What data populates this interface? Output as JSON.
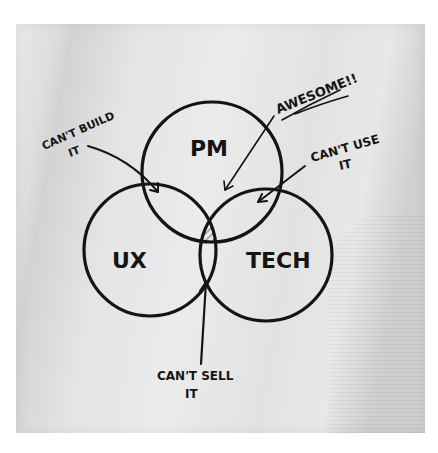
{
  "diagram": {
    "type": "venn",
    "medium": "hand-drawn on napkin",
    "circles": [
      {
        "id": "pm",
        "label": "PM"
      },
      {
        "id": "ux",
        "label": "UX"
      },
      {
        "id": "tech",
        "label": "TECH"
      }
    ],
    "annotations": [
      {
        "id": "cant-build",
        "line1": "CAN'T BUILD",
        "line2": "IT",
        "points_to": "PM ∩ UX"
      },
      {
        "id": "awesome",
        "line1": "AWESOME!!",
        "points_to": "PM ∩ UX ∩ TECH"
      },
      {
        "id": "cant-use",
        "line1": "CAN'T USE",
        "line2": "IT",
        "points_to": "PM ∩ TECH"
      },
      {
        "id": "cant-sell",
        "line1": "CAN'T SELL",
        "line2": "IT",
        "points_to": "UX ∩ TECH"
      }
    ],
    "highlight": "center intersection hatched",
    "colors": {
      "ink": "#141414",
      "napkin": "#e6e6e6",
      "background": "#ffffff"
    }
  }
}
